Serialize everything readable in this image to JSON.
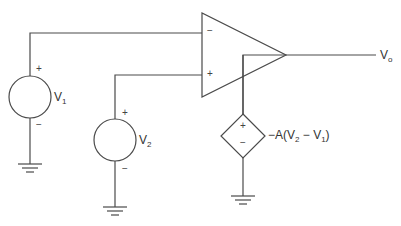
{
  "diagram": {
    "type": "circuit",
    "opamp": {
      "inverting_label": "−",
      "noninverting_label": "+"
    },
    "sources": {
      "v1": {
        "name": "V",
        "sub": "1",
        "plus": "+",
        "minus": "−"
      },
      "v2": {
        "name": "V",
        "sub": "2",
        "plus": "+",
        "minus": "−"
      },
      "dependent": {
        "plus": "+",
        "minus": "−",
        "expr_prefix": "−A(V",
        "expr_sub1": "2",
        "expr_mid": " − V",
        "expr_sub2": "1",
        "expr_suffix": ")"
      }
    },
    "output": {
      "name": "V",
      "sub": "o"
    },
    "colors": {
      "line": "#4a4a4a",
      "text": "#333333",
      "background": "#ffffff"
    }
  }
}
